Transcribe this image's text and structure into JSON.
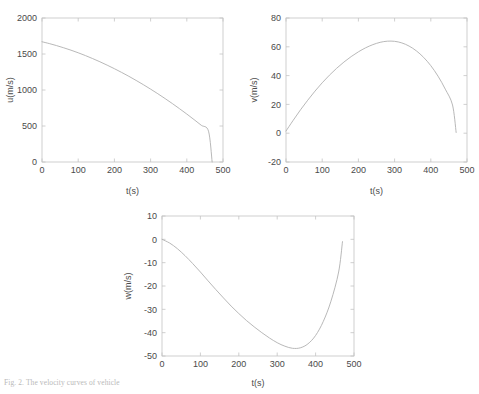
{
  "figure": {
    "caption": "Fig. 2. The velocity curves of vehicle"
  },
  "chart_data": [
    {
      "type": "line",
      "panel": "u",
      "title": "",
      "xlabel": "t(s)",
      "ylabel": "u(m/s)",
      "xlim": [
        0,
        500
      ],
      "ylim": [
        0,
        2000
      ],
      "xticks": [
        0,
        100,
        200,
        300,
        400,
        500
      ],
      "yticks": [
        0,
        500,
        1000,
        1500,
        2000
      ],
      "grid": false,
      "legend": "none",
      "x": [
        0,
        20,
        40,
        60,
        80,
        100,
        120,
        140,
        160,
        180,
        200,
        220,
        240,
        260,
        280,
        300,
        320,
        340,
        360,
        380,
        400,
        420,
        440,
        460,
        470
      ],
      "values": [
        1670,
        1645,
        1617,
        1586,
        1553,
        1517,
        1478,
        1436,
        1392,
        1345,
        1296,
        1244,
        1190,
        1133,
        1074,
        1012,
        948,
        881,
        812,
        740,
        666,
        589,
        510,
        428,
        0
      ]
    },
    {
      "type": "line",
      "panel": "v",
      "title": "",
      "xlabel": "t(s)",
      "ylabel": "v(m/s)",
      "xlim": [
        0,
        500
      ],
      "ylim": [
        -20,
        80
      ],
      "xticks": [
        0,
        100,
        200,
        300,
        400,
        500
      ],
      "yticks": [
        -20,
        0,
        20,
        40,
        60,
        80
      ],
      "grid": false,
      "legend": "none",
      "x": [
        0,
        20,
        40,
        60,
        80,
        100,
        120,
        140,
        160,
        180,
        200,
        220,
        240,
        260,
        280,
        300,
        320,
        340,
        360,
        380,
        400,
        420,
        440,
        460,
        470
      ],
      "values": [
        1.5,
        9.0,
        16.2,
        22.9,
        29.2,
        35.0,
        40.3,
        45.1,
        49.4,
        53.2,
        56.5,
        59.3,
        61.5,
        63.1,
        63.9,
        63.8,
        62.7,
        60.5,
        57.2,
        52.7,
        46.9,
        39.6,
        30.6,
        19.6,
        0.5
      ]
    },
    {
      "type": "line",
      "panel": "w",
      "title": "",
      "xlabel": "t(s)",
      "ylabel": "w(m/s)",
      "xlim": [
        0,
        500
      ],
      "ylim": [
        -50,
        10
      ],
      "xticks": [
        0,
        100,
        200,
        300,
        400,
        500
      ],
      "yticks": [
        -50,
        -40,
        -30,
        -20,
        -10,
        0,
        10
      ],
      "grid": false,
      "legend": "none",
      "x": [
        0,
        20,
        40,
        60,
        80,
        100,
        120,
        140,
        160,
        180,
        200,
        220,
        240,
        260,
        280,
        300,
        320,
        340,
        360,
        380,
        400,
        420,
        440,
        460,
        470
      ],
      "values": [
        0,
        -1.6,
        -4.0,
        -7.0,
        -10.4,
        -14.0,
        -17.8,
        -21.5,
        -25.1,
        -28.6,
        -31.8,
        -34.8,
        -37.5,
        -40.0,
        -42.3,
        -44.3,
        -45.8,
        -46.7,
        -46.5,
        -44.8,
        -41.2,
        -35.2,
        -26.5,
        -14.0,
        -1.0
      ]
    }
  ]
}
